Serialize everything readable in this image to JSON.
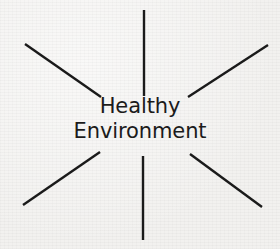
{
  "canvas": {
    "width": 280,
    "height": 249,
    "background_color": "#f2f1ef",
    "ink_color": "#1a1a1a",
    "text_color": "#1b1b1b"
  },
  "diagram": {
    "type": "radial-burst",
    "center_label": {
      "line1": "Healthy",
      "line2": "Environment"
    },
    "ray_count": 6,
    "rays": [
      {
        "name": "ray-top",
        "x1": 144,
        "y1": 10,
        "x2": 144,
        "y2": 96,
        "orientation": "vertical"
      },
      {
        "name": "ray-upper-left",
        "x1": 25,
        "y1": 44,
        "x2": 101,
        "y2": 97,
        "orientation": "diagonal"
      },
      {
        "name": "ray-upper-right",
        "x1": 188,
        "y1": 97,
        "x2": 268,
        "y2": 45,
        "orientation": "diagonal"
      },
      {
        "name": "ray-lower-left",
        "x1": 23,
        "y1": 205,
        "x2": 100,
        "y2": 152,
        "orientation": "diagonal"
      },
      {
        "name": "ray-lower-right",
        "x1": 190,
        "y1": 154,
        "x2": 262,
        "y2": 207,
        "orientation": "diagonal"
      },
      {
        "name": "ray-bottom",
        "x1": 143,
        "y1": 156,
        "x2": 143,
        "y2": 240,
        "orientation": "vertical"
      }
    ],
    "stroke_width": 2.4
  }
}
